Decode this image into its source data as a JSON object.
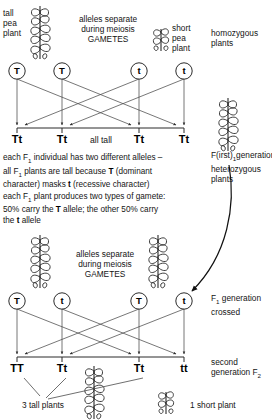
{
  "diagram": {
    "type": "genetics-punnett-cross"
  },
  "parental": {
    "tall_label": "tall\npea\nplant",
    "short_label": "short\npea\nplant",
    "meiosis_label": "alleles separate\nduring meiosis\nGAMETES",
    "homozygous_label": "homozygous\nplants",
    "gametes": [
      "T",
      "T",
      "t",
      "t"
    ]
  },
  "f1": {
    "genotypes": [
      "Tt",
      "Tt",
      "Tt",
      "Tt"
    ],
    "phenotype_label": "all tall",
    "side_label": "F(irst)",
    "side_label_sub": "1",
    "side_label_rest": "generation\nheterozygous\nplants",
    "explanation_line1": "each F",
    "explanation_line1_sub": "1",
    "explanation_line1_rest": " individual has two different alleles –",
    "explanation_line2_a": "all F",
    "explanation_line2_sub": "1",
    "explanation_line2_b": " plants are tall because ",
    "explanation_line2_bold": "T",
    "explanation_line2_c": " (dominant",
    "explanation_line3_a": "character) masks ",
    "explanation_line3_bold": "t",
    "explanation_line3_b": " (recessive character)",
    "explanation_line4_a": "each F",
    "explanation_line4_sub": "1",
    "explanation_line4_b": " plant produces two types of gamete:",
    "explanation_line5_a": "50% carry the ",
    "explanation_line5_bold": "T",
    "explanation_line5_b": " allele; the other 50% carry",
    "explanation_line6_a": "the ",
    "explanation_line6_bold": "t",
    "explanation_line6_b": " allele"
  },
  "f1_cross": {
    "meiosis_label": "alleles separate\nduring meiosis\nGAMETES",
    "gametes": [
      "T",
      "t",
      "T",
      "t"
    ],
    "side_label_a": "F",
    "side_label_sub": "1",
    "side_label_b": " generation\ncrossed"
  },
  "f2": {
    "genotypes": [
      "TT",
      "Tt",
      "Tt",
      "tt"
    ],
    "side_label_a": "second\ngeneration F",
    "side_label_sub": "2",
    "tall_count_label": "3 tall plants",
    "short_count_label": "1 short plant"
  },
  "colors": {
    "ink": "#141414",
    "line": "#3a3a3a",
    "background": "#ffffff"
  }
}
